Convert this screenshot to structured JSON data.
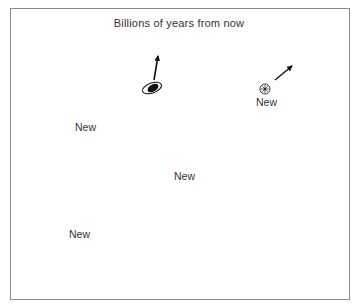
{
  "diagram": {
    "title": "Billions of years from now",
    "new_label": "New",
    "objects": [
      {
        "id": "spiral-galaxy-top",
        "type": "galaxy-with-ring",
        "arrow": "up-right"
      },
      {
        "id": "new-galaxy-top-right",
        "type": "new-galaxy",
        "label": "New",
        "arrow": "up-right"
      },
      {
        "id": "new-galaxy-left",
        "type": "new-galaxy",
        "label": "New",
        "arrow": "up-left"
      },
      {
        "id": "new-galaxy-center",
        "type": "new-galaxy",
        "label": "New",
        "arrow": "up"
      },
      {
        "id": "galaxy-left-edge",
        "type": "galaxy",
        "arrow": "left"
      },
      {
        "id": "new-galaxy-bottom-left",
        "type": "new-galaxy",
        "label": "New",
        "arrow": "down-left"
      },
      {
        "id": "galaxy-bottom-center",
        "type": "galaxy",
        "arrow": "down"
      },
      {
        "id": "galaxy-bottom-right",
        "type": "galaxy",
        "arrow": "down-right"
      }
    ],
    "colors": {
      "ink": "#111111",
      "frame": "#8a8a8a",
      "text": "#333333"
    }
  }
}
